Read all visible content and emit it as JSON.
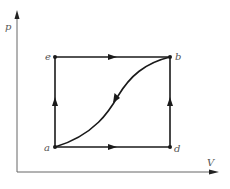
{
  "diagram": {
    "type": "pV-diagram",
    "axes": {
      "x_label": "V",
      "y_label": "p"
    },
    "points": [
      {
        "id": "e",
        "label": "e"
      },
      {
        "id": "b",
        "label": "b"
      },
      {
        "id": "a",
        "label": "a"
      },
      {
        "id": "d",
        "label": "d"
      }
    ],
    "paths": [
      {
        "from": "a",
        "to": "e",
        "kind": "isochoric",
        "direction": "up"
      },
      {
        "from": "e",
        "to": "b",
        "kind": "isobaric",
        "direction": "right"
      },
      {
        "from": "a",
        "to": "d",
        "kind": "isobaric",
        "direction": "right"
      },
      {
        "from": "d",
        "to": "b",
        "kind": "isochoric",
        "direction": "up"
      },
      {
        "from": "b",
        "to": "a",
        "kind": "curve",
        "direction": "down-left"
      }
    ],
    "colors": {
      "line": "#1a1a1a",
      "axis": "#555555",
      "label": "#555555"
    }
  }
}
